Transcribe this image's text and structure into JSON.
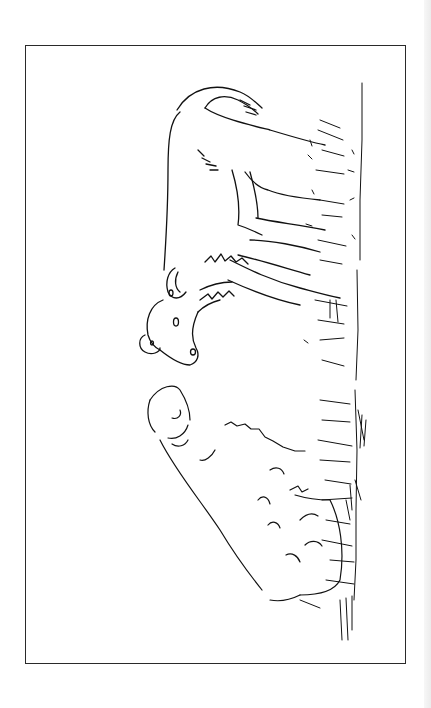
{
  "page": {
    "background": "#ffffff",
    "frame_color": "#2a2a2a",
    "ink_color": "#111111"
  },
  "illustration": {
    "subject": "line drawing of a calf and a sheep in grass",
    "orientation": "rotated 90 degrees",
    "figures": [
      "calf",
      "sheep",
      "grass"
    ]
  }
}
